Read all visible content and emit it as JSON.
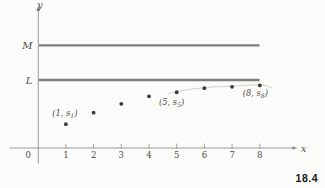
{
  "figure_label": "18.4",
  "colors": {
    "background": "#fbfbf9",
    "bound_line": "#7e7e7c",
    "axis": "#8f8f8d",
    "point": "#3a3a38",
    "text": "#4b4b49",
    "faint_curve": "#cbcbc4",
    "figure_label_color": "#161616"
  },
  "chart_data": {
    "type": "scatter",
    "xlabel": "x",
    "ylabel": "y",
    "origin_label": "0",
    "x": [
      1,
      2,
      3,
      4,
      5,
      6,
      7,
      8
    ],
    "x_tick_labels": [
      "1",
      "2",
      "3",
      "4",
      "5",
      "6",
      "7",
      "8"
    ],
    "values": [
      0.35,
      0.52,
      0.65,
      0.76,
      0.82,
      0.88,
      0.9,
      0.92
    ],
    "xlim": [
      0,
      8.7
    ],
    "grid": false,
    "legend": null,
    "reference_lines": [
      {
        "label": "M",
        "value": 1.51
      },
      {
        "label": "L",
        "value": 1.0
      }
    ],
    "point_labels": [
      {
        "x": 1,
        "pre": "(1, s",
        "sub": "1",
        "post": ")"
      },
      {
        "x": 5,
        "pre": "(5, s",
        "sub": "5",
        "post": ")"
      },
      {
        "x": 8,
        "pre": "(8, s",
        "sub": "8",
        "post": ")"
      }
    ]
  }
}
